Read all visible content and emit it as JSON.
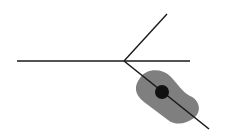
{
  "diagram": {
    "background": "#ffffff",
    "line_color": "#1a1a1a",
    "blob_color": "#7f7f7f",
    "dot_color": "#111111",
    "junction": {
      "x": 124,
      "y": 61
    },
    "horizontal_line": {
      "x1": 17,
      "y1": 61,
      "x2": 190,
      "y2": 61
    },
    "upper_branch": {
      "x1": 124,
      "y1": 61,
      "x2": 167,
      "y2": 14
    },
    "lower_branch": {
      "x1": 124,
      "y1": 61,
      "x2": 209,
      "y2": 129
    },
    "dot": {
      "cx": 162,
      "cy": 92,
      "r": 7
    }
  }
}
